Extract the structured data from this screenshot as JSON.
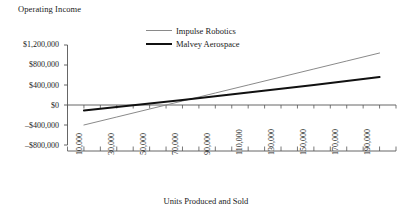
{
  "chart_data": {
    "type": "line",
    "title": "Operating Income",
    "xlabel": "Units Produced and Sold",
    "ylabel": "",
    "x": [
      10000,
      30000,
      50000,
      70000,
      90000,
      110000,
      130000,
      150000,
      170000,
      190000
    ],
    "xtick_labels": [
      "10,000",
      "30,000",
      "50,000",
      "70,000",
      "90,000",
      "110,000",
      "130,000",
      "150,000",
      "170,000",
      "190,000"
    ],
    "ytick_labels": [
      "$1,200,000",
      "$800,000",
      "$400,000",
      "$0",
      "–$400,000",
      "–$800,000"
    ],
    "ytick_values": [
      1200000,
      800000,
      400000,
      0,
      -400000,
      -800000
    ],
    "ylim": [
      -800000,
      1200000
    ],
    "xlim": [
      0,
      200000
    ],
    "grid": false,
    "legend_position": "top-center",
    "series": [
      {
        "name": "Impulse Robotics",
        "color": "#8a8a8a",
        "width": 1,
        "values": [
          -400000,
          -240000,
          -80000,
          80000,
          240000,
          400000,
          560000,
          720000,
          880000,
          1040000
        ]
      },
      {
        "name": "Malvey Aerospace",
        "color": "#111111",
        "width": 2,
        "values": [
          -110000,
          -40000,
          30000,
          100000,
          175000,
          250000,
          325000,
          400000,
          480000,
          560000
        ]
      }
    ]
  },
  "chart": {
    "title": "Operating Income",
    "xaxis_title": "Units Produced and Sold",
    "legend": [
      {
        "label": "Impulse Robotics",
        "series_key": "impulse-robotics"
      },
      {
        "label": "Malvey Aerospace",
        "series_key": "malvey-aerospace"
      }
    ],
    "ytick_labels": [
      "$1,200,000",
      "$800,000",
      "$400,000",
      "$0",
      "–$400,000",
      "–$800,000"
    ],
    "xtick_labels": [
      "10,000",
      "30,000",
      "50,000",
      "70,000",
      "90,000",
      "110,000",
      "130,000",
      "150,000",
      "170,000",
      "190,000"
    ]
  },
  "colors": {
    "impulse": "#8a8a8a",
    "malvey": "#111111",
    "axis": "#555555",
    "text": "#1a1a1a"
  }
}
